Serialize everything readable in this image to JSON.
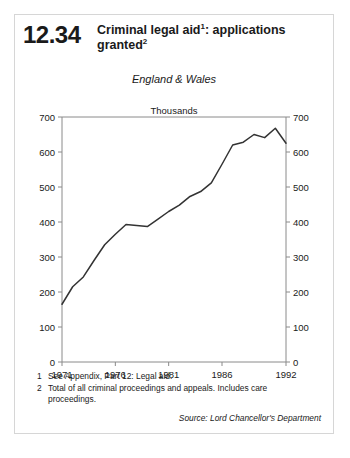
{
  "card": {
    "chart_number": "12.34",
    "title_line1": "Criminal legal aid",
    "title_sup1": "1",
    "title_line1_tail": ": applications",
    "title_line2": "granted",
    "title_sup2": "2"
  },
  "footnotes": [
    {
      "num": "1",
      "text": "See Appendix, Part 12: Legal aid."
    },
    {
      "num": "2",
      "text": "Total of all criminal proceedings and appeals. Includes care proceedings."
    }
  ],
  "source": "Source: Lord Chancellor's Department",
  "chart_data": {
    "type": "line",
    "subtitle": "England & Wales",
    "ylabel": "Thousands",
    "xlabel": "",
    "xlim": [
      1971,
      1992
    ],
    "ylim": [
      0,
      700
    ],
    "ytick_values": [
      0,
      100,
      200,
      300,
      400,
      500,
      600,
      700
    ],
    "ytick_labels": [
      "0",
      "100",
      "200",
      "300",
      "400",
      "500",
      "600",
      "700"
    ],
    "xtick_values": [
      1971,
      1976,
      1981,
      1986,
      1992
    ],
    "xtick_labels": [
      "1971",
      "1976",
      "1981",
      "1986",
      "1992"
    ],
    "grid": false,
    "legend": false,
    "right_axis_mirrored": true,
    "line_color": "#333333",
    "x": [
      1971,
      1972,
      1973,
      1974,
      1975,
      1976,
      1977,
      1978,
      1979,
      1980,
      1981,
      1982,
      1983,
      1984,
      1985,
      1986,
      1987,
      1988,
      1989,
      1990,
      1991,
      1992
    ],
    "values": [
      165,
      215,
      243,
      290,
      335,
      365,
      393,
      390,
      387,
      408,
      430,
      448,
      473,
      487,
      512,
      565,
      620,
      628,
      650,
      641,
      668,
      625
    ],
    "series": [
      {
        "name": "Applications granted",
        "values": [
          165,
          215,
          243,
          290,
          335,
          365,
          393,
          390,
          387,
          408,
          430,
          448,
          473,
          487,
          512,
          565,
          620,
          628,
          650,
          641,
          668,
          625
        ]
      }
    ]
  }
}
